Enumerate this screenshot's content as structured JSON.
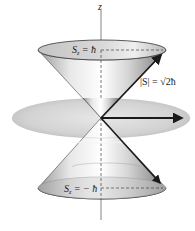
{
  "diagram": {
    "type": "spin-angular-momentum-cones",
    "axis": {
      "label": "z"
    },
    "upper_cone": {
      "label": "S_z = ħ",
      "label_main": "S",
      "label_sub": "z",
      "label_rest": " = ħ"
    },
    "lower_cone": {
      "label": "S_z = −ħ",
      "label_main": "S",
      "label_sub": "z",
      "label_rest": " = − ħ"
    },
    "magnitude": {
      "label": "|S| = √2ħ",
      "label_text": "|S| = √2ħ"
    },
    "colors": {
      "cone_light": "#f2f2f2",
      "cone_mid": "#c8c8c8",
      "cone_dark": "#8a8a8a",
      "disk": "#cfcfcf",
      "arrow": "#1a1a1a",
      "axis": "#555555"
    }
  }
}
